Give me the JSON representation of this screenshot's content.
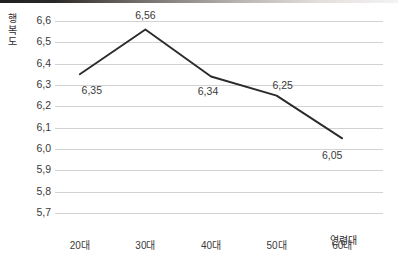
{
  "chart_data": {
    "type": "line",
    "title": "",
    "xlabel": "연령대",
    "ylabel": "행복도",
    "categories": [
      "20대",
      "30대",
      "40대",
      "50대",
      "60대"
    ],
    "values": [
      6.35,
      6.56,
      6.34,
      6.25,
      6.05
    ],
    "point_labels": [
      "6,35",
      "6,56",
      "6,34",
      "6,25",
      "6,05"
    ],
    "ylim": [
      5.7,
      6.6
    ],
    "ytick_values": [
      6.6,
      6.5,
      6.4,
      6.3,
      6.2,
      6.1,
      6.0,
      5.9,
      5.8,
      5.7
    ],
    "ytick_labels": [
      "6,6",
      "6,5",
      "6,4",
      "6,3",
      "6,2",
      "6,1",
      "6,0",
      "5,9",
      "5,8",
      "5,7"
    ],
    "grid": "horizontal",
    "legend": "none",
    "series": [
      {
        "name": "행복도",
        "values": [
          6.35,
          6.56,
          6.34,
          6.25,
          6.05
        ]
      }
    ],
    "colors": {
      "line": "#2b2b2b",
      "grid": "#d2d2d2",
      "text": "#3a3a3a",
      "background": "#ffffff"
    }
  },
  "axes": {
    "y_title_chars": [
      "행",
      "복",
      "도"
    ],
    "x_title": "연령대"
  }
}
